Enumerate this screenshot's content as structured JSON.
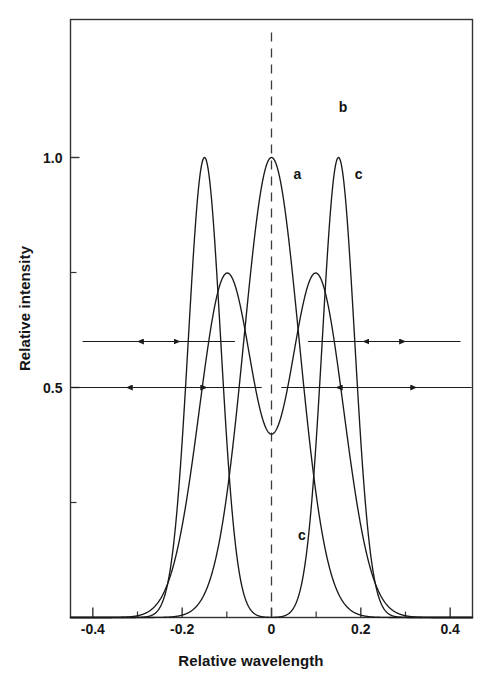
{
  "figure": {
    "title": "",
    "xlabel": "Relative wavelength",
    "ylabel": "Relative intensity"
  },
  "axes": {
    "x_ticks": [
      "-0.4",
      "-0.2",
      "0",
      "0.2",
      "0.4"
    ],
    "y_ticks": [
      "1.0",
      "0.5"
    ]
  },
  "curve_labels": [
    {
      "text": "b",
      "x": 0.16,
      "y": 1.11
    },
    {
      "text": "a",
      "x": 0.058,
      "y": 0.965
    },
    {
      "text": "c",
      "x": 0.195,
      "y": 0.965
    },
    {
      "text": "c",
      "x": 0.068,
      "y": 0.18
    }
  ],
  "colors": {
    "curve": "#1a1a1a",
    "axis": "#333333",
    "dashed_center": "#3a3a3a",
    "background": "#ffffff"
  },
  "chart_data": {
    "type": "line",
    "title": "",
    "xlabel": "Relative wavelength",
    "ylabel": "Relative intensity",
    "xlim": [
      -0.45,
      0.45
    ],
    "ylim": [
      0.0,
      1.32
    ],
    "grid": false,
    "legend": "inline-curve-labels",
    "x_ticks": [
      -0.4,
      -0.2,
      0,
      0.2,
      0.4
    ],
    "x_minor_ticks": [
      -0.3,
      -0.1,
      0.1,
      0.3
    ],
    "y_ticks": [
      1.0,
      0.5
    ],
    "y_minor_ticks": [
      0.75,
      0.25
    ],
    "center_line": {
      "x": 0.0,
      "style": "dashed",
      "from_y": 0.0,
      "to_y": 1.28
    },
    "series": [
      {
        "name": "a",
        "description": "Single Gaussian line centred at zero, unit peak, FWHM 0.145",
        "model": "gaussian",
        "center": 0.0,
        "amplitude": 1.0,
        "fwhm": 0.145,
        "peak_xy": [
          0.0,
          1.0
        ]
      },
      {
        "name": "b",
        "description": "Unresolved sum of two Gaussians at -0.10 and +0.10, FWHM 0.145 each; double hump with central dip at 1.0",
        "model": "sum-of-two-gaussians",
        "centers": [
          -0.1,
          0.1
        ],
        "amplitude_each": 0.745,
        "fwhm_each": 0.145,
        "peaks_xy": [
          [
            -0.108,
            1.135
          ],
          [
            0.108,
            1.135
          ]
        ],
        "central_minimum_xy": [
          0.0,
          1.0
        ]
      },
      {
        "name": "c",
        "description": "Resolved doublet: two narrow Gaussians at -0.15 and +0.15, unit peaks, FWHM 0.085, valley at zero",
        "model": "sum-of-two-gaussians",
        "centers": [
          -0.15,
          0.15
        ],
        "amplitude_each": 1.0,
        "fwhm_each": 0.085,
        "peaks_xy": [
          [
            -0.15,
            1.0
          ],
          [
            0.15,
            1.0
          ]
        ],
        "central_minimum_xy": [
          0.0,
          0.0
        ]
      }
    ],
    "annotations": [
      {
        "type": "double-arrow",
        "label": "",
        "y": 0.6,
        "x_start": -0.3,
        "x_end": -0.205,
        "side": "left",
        "note": "width marker at 0.60 intensity, left side"
      },
      {
        "type": "double-arrow",
        "label": "",
        "y": 0.6,
        "x_start": 0.205,
        "x_end": 0.3,
        "side": "right",
        "note": "width marker at 0.60 intensity, right side"
      },
      {
        "type": "double-arrow",
        "label": "",
        "y": 0.5,
        "x_start": -0.325,
        "x_end": -0.145,
        "side": "left",
        "note": "half-width marker at 0.50 intensity, left side"
      },
      {
        "type": "double-arrow",
        "label": "",
        "y": 0.5,
        "x_start": 0.145,
        "x_end": 0.325,
        "side": "right",
        "note": "half-width marker at 0.50 intensity, right side"
      }
    ]
  }
}
